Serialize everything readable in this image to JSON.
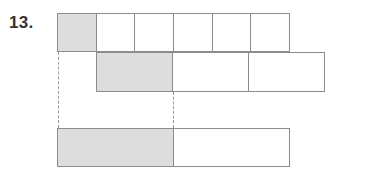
{
  "problem": {
    "number_label": "13."
  },
  "colors": {
    "shaded_fill": "#dddddd",
    "unshaded_fill": "#ffffff",
    "stroke": "#8c8c8c",
    "dashed_stroke": "#9a9a9a",
    "label_text": "#333333",
    "background": "#ffffff"
  },
  "diagram": {
    "type": "fraction-bar-comparison",
    "bars": [
      {
        "id": "bar-top",
        "name": "top-bar",
        "x": 57,
        "y": 13,
        "width": 233,
        "height": 39,
        "cell_count": 6,
        "shaded_cells": 1,
        "cells": [
          {
            "shaded": true
          },
          {
            "shaded": false
          },
          {
            "shaded": false
          },
          {
            "shaded": false
          },
          {
            "shaded": false
          },
          {
            "shaded": false
          }
        ]
      },
      {
        "id": "bar-middle",
        "name": "middle-bar",
        "x": 96,
        "y": 52,
        "width": 229,
        "height": 40,
        "cell_count": 3,
        "shaded_cells": 1,
        "cells": [
          {
            "shaded": true
          },
          {
            "shaded": false
          },
          {
            "shaded": false
          }
        ]
      },
      {
        "id": "bar-bottom",
        "name": "bottom-bar",
        "x": 57,
        "y": 128,
        "width": 233,
        "height": 39,
        "cell_count": 2,
        "shaded_cells": 1,
        "cells": [
          {
            "shaded": true,
            "flex": 116
          },
          {
            "shaded": false,
            "flex": 117
          }
        ]
      }
    ],
    "guides": [
      {
        "id": "guide-left",
        "name": "left-alignment-guide",
        "x": 58,
        "y": 52,
        "height": 76
      },
      {
        "id": "guide-right",
        "name": "right-alignment-guide",
        "x": 173,
        "y": 92,
        "height": 36
      }
    ]
  }
}
